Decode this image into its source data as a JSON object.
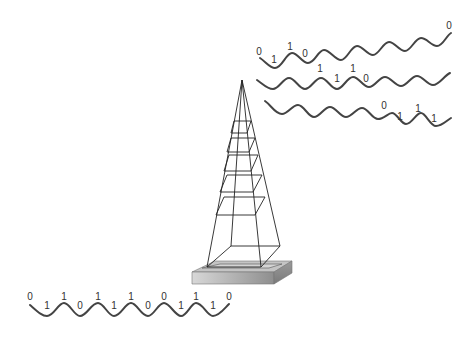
{
  "diagram": {
    "type": "transmission-tower-binary-signal",
    "colors": {
      "background": "#ffffff",
      "wave": "#444444",
      "tower_lines": "#222222",
      "base_top": "#c8c8c8",
      "base_inner": "#d6d6d6",
      "base_side": "#a8a8a8",
      "bit_text": "#333333"
    },
    "input_signal": {
      "bits": [
        "0",
        "1",
        "1",
        "0",
        "1",
        "1",
        "1",
        "0",
        "0",
        "1",
        "1",
        "1",
        "0"
      ],
      "label_positions": [
        {
          "x": 30,
          "y": 300,
          "bit": "0"
        },
        {
          "x": 47,
          "y": 309,
          "bit": "1"
        },
        {
          "x": 64,
          "y": 300,
          "bit": "1"
        },
        {
          "x": 80,
          "y": 309,
          "bit": "0"
        },
        {
          "x": 98,
          "y": 300,
          "bit": "1"
        },
        {
          "x": 114,
          "y": 309,
          "bit": "1"
        },
        {
          "x": 131,
          "y": 300,
          "bit": "1"
        },
        {
          "x": 148,
          "y": 309,
          "bit": "0"
        },
        {
          "x": 164,
          "y": 300,
          "bit": "0"
        },
        {
          "x": 181,
          "y": 309,
          "bit": "1"
        },
        {
          "x": 196,
          "y": 300,
          "bit": "1"
        },
        {
          "x": 213,
          "y": 309,
          "bit": "1"
        },
        {
          "x": 229,
          "y": 300,
          "bit": "0"
        }
      ]
    },
    "output_signals": [
      {
        "name": "stream-1",
        "labels": [
          {
            "x": 259,
            "y": 55,
            "bit": "0"
          },
          {
            "x": 274,
            "y": 63,
            "bit": "1"
          },
          {
            "x": 290,
            "y": 50,
            "bit": "1"
          },
          {
            "x": 305,
            "y": 57,
            "bit": "0"
          },
          {
            "x": 449,
            "y": 29,
            "bit": "0"
          }
        ]
      },
      {
        "name": "stream-2",
        "labels": [
          {
            "x": 320,
            "y": 72,
            "bit": "1"
          },
          {
            "x": 337,
            "y": 82,
            "bit": "1"
          },
          {
            "x": 353,
            "y": 72,
            "bit": "1"
          },
          {
            "x": 366,
            "y": 82,
            "bit": "0"
          }
        ]
      },
      {
        "name": "stream-3",
        "labels": [
          {
            "x": 384,
            "y": 109,
            "bit": "0"
          },
          {
            "x": 400,
            "y": 120,
            "bit": "1"
          },
          {
            "x": 418,
            "y": 112,
            "bit": "1"
          },
          {
            "x": 434,
            "y": 122,
            "bit": "1"
          }
        ]
      }
    ]
  }
}
